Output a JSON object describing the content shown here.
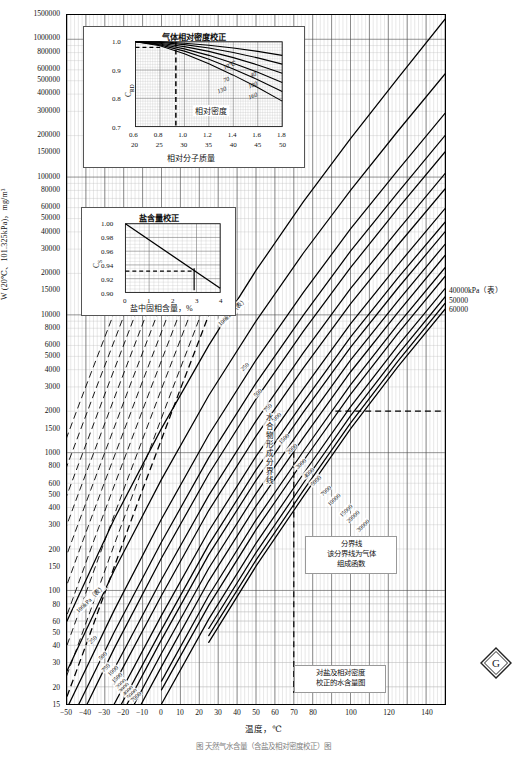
{
  "figure": {
    "caption": "图   天然气水含量（含盐及相对密度校正）图"
  },
  "axes": {
    "y_title": "W (20℃、101.325kPa)，mg/m³",
    "x_title": "温度，℃",
    "y_ticks": [
      "1500000",
      "1000000",
      "800000",
      "600000",
      "500000",
      "400000",
      "300000",
      "200000",
      "150000",
      "100000",
      "80000",
      "60000",
      "50000",
      "40000",
      "30000",
      "20000",
      "15000",
      "10000",
      "8000",
      "6000",
      "5000",
      "4000",
      "3000",
      "2000",
      "1500",
      "1000",
      "800",
      "600",
      "500",
      "400",
      "300",
      "200",
      "150",
      "100",
      "80",
      "60",
      "50",
      "40",
      "30",
      "20",
      "15"
    ],
    "x_ticks": [
      "-50",
      "-40",
      "-30",
      "-20",
      "-10",
      "0",
      "10",
      "20",
      "30",
      "40",
      "50",
      "60",
      "70",
      "80",
      "100",
      "120",
      "140"
    ]
  },
  "right_labels": [
    "40000kPa（表）",
    "50000",
    "60000"
  ],
  "pressure_labels": [
    "100kPa（表）",
    "250",
    "500",
    "750",
    "1000",
    "1500",
    "2000",
    "3000",
    "4000",
    "5000",
    "7000",
    "10000",
    "15000",
    "20000",
    "30000"
  ],
  "annotations": {
    "hydrate_line": "水合物形成分界线",
    "boundary_note": "分界线\n该分界线为气体\n组成函数",
    "corrected_note": "对盐及相对密度\n校正的水含量图",
    "logo": "gas-processors-logo"
  },
  "inset_density": {
    "title": "气体相对密度校正",
    "y_label": "C",
    "y_sub": "RD",
    "x_label_top": "相对密度",
    "x_label_bottom": "相对分子质量",
    "y_ticks": [
      "1.0",
      "0.9",
      "0.8",
      "0.7"
    ],
    "x_ticks_density": [
      "0.6",
      "0.8",
      "1.0",
      "1.2",
      "1.4",
      "1.6",
      "1.8"
    ],
    "x_ticks_mass": [
      "20",
      "25",
      "30",
      "35",
      "40",
      "45",
      "50"
    ],
    "curve_labels": [
      "10℃",
      "40",
      "70",
      "100",
      "130",
      "160"
    ]
  },
  "inset_salt": {
    "title": "盐含量校正",
    "y_label": "C",
    "y_sub": "S",
    "x_label": "盐中固相含量，%",
    "y_ticks": [
      "1.00",
      "0.98",
      "0.96",
      "0.94",
      "0.92",
      "0.90"
    ],
    "x_ticks": [
      "0",
      "1",
      "2",
      "3",
      "4"
    ]
  },
  "chart_data": {
    "type": "line",
    "xlabel": "温度，℃",
    "ylabel": "W (20℃、101.325kPa)，mg/m³",
    "xlim": [
      -50,
      150
    ],
    "ylim": [
      15,
      1500000
    ],
    "yscale": "log",
    "xscale": "linear",
    "grid": true,
    "legend": "inline curve labels",
    "series": [
      {
        "name": "100kPa（表）",
        "x": [
          -50,
          -25,
          0,
          25,
          50,
          75,
          100,
          125,
          150
        ],
        "values": [
          60,
          330,
          1500,
          6000,
          21000,
          66000,
          190000,
          520000,
          1400000
        ]
      },
      {
        "name": "250",
        "x": [
          -50,
          -25,
          0,
          25,
          50,
          75,
          100,
          125,
          150
        ],
        "values": [
          26,
          140,
          640,
          2600,
          9000,
          28000,
          80000,
          215000,
          560000
        ]
      },
      {
        "name": "500",
        "x": [
          -50,
          -25,
          0,
          25,
          50,
          75,
          100,
          125,
          150
        ],
        "values": [
          14,
          72,
          330,
          1350,
          4700,
          14500,
          42000,
          112000,
          290000
        ]
      },
      {
        "name": "750",
        "x": [
          -50,
          -25,
          0,
          25,
          50,
          75,
          100,
          125,
          150
        ],
        "values": [
          10,
          50,
          225,
          920,
          3200,
          9900,
          29000,
          77000,
          200000
        ]
      },
      {
        "name": "1000",
        "x": [
          -50,
          -25,
          0,
          25,
          50,
          75,
          100,
          125,
          150
        ],
        "values": [
          7.5,
          38,
          172,
          700,
          2450,
          7600,
          22000,
          59000,
          152000
        ]
      },
      {
        "name": "1500",
        "x": [
          -25,
          0,
          25,
          50,
          75,
          100,
          125,
          150
        ],
        "values": [
          27,
          120,
          490,
          1700,
          5300,
          15500,
          41000,
          106000
        ]
      },
      {
        "name": "2000",
        "x": [
          -25,
          0,
          25,
          50,
          75,
          100,
          125,
          150
        ],
        "values": [
          21,
          92,
          380,
          1320,
          4100,
          12000,
          32000,
          82000
        ]
      },
      {
        "name": "3000",
        "x": [
          -25,
          0,
          25,
          50,
          75,
          100,
          125,
          150
        ],
        "values": [
          15,
          66,
          270,
          940,
          2900,
          8600,
          23000,
          59000
        ]
      },
      {
        "name": "4000",
        "x": [
          -25,
          0,
          25,
          50,
          75,
          100,
          125,
          150
        ],
        "values": [
          12,
          52,
          215,
          750,
          2320,
          6900,
          18500,
          47000
        ]
      },
      {
        "name": "5000",
        "x": [
          -25,
          0,
          25,
          50,
          75,
          100,
          125,
          150
        ],
        "values": [
          10,
          44,
          182,
          630,
          1960,
          5800,
          15600,
          40000
        ]
      },
      {
        "name": "7000",
        "x": [
          -25,
          0,
          25,
          50,
          75,
          100,
          125,
          150
        ],
        "values": [
          8,
          35,
          145,
          505,
          1570,
          4700,
          12600,
          32500
        ]
      },
      {
        "name": "10000",
        "x": [
          -25,
          0,
          25,
          50,
          75,
          100,
          125,
          150
        ],
        "values": [
          6.5,
          28,
          117,
          410,
          1280,
          3850,
          10400,
          27000
        ]
      },
      {
        "name": "15000",
        "x": [
          0,
          25,
          50,
          75,
          100,
          125,
          150
        ],
        "values": [
          22,
          92,
          325,
          1020,
          3100,
          8500,
          22000
        ]
      },
      {
        "name": "20000",
        "x": [
          0,
          25,
          50,
          75,
          100,
          125,
          150
        ],
        "values": [
          19,
          78,
          276,
          870,
          2650,
          7300,
          19000
        ]
      },
      {
        "name": "30000",
        "x": [
          0,
          25,
          50,
          75,
          100,
          125,
          150
        ],
        "values": [
          15,
          62,
          220,
          700,
          2150,
          5950,
          15500
        ]
      },
      {
        "name": "40000kPa（表）",
        "x": [
          25,
          50,
          75,
          100,
          125,
          150
        ],
        "values": [
          53,
          188,
          600,
          1850,
          5150,
          13500
        ]
      },
      {
        "name": "50000",
        "x": [
          25,
          50,
          75,
          100,
          125,
          150
        ],
        "values": [
          47,
          166,
          530,
          1640,
          4600,
          12100
        ]
      },
      {
        "name": "60000",
        "x": [
          25,
          50,
          75,
          100,
          125,
          150
        ],
        "values": [
          42,
          150,
          480,
          1490,
          4200,
          11000
        ]
      }
    ],
    "hydrate_boundary": {
      "name": "水合物形成分界线",
      "x": [
        -50,
        -40,
        -30,
        -20,
        -10,
        0,
        10,
        20,
        25
      ],
      "values": [
        17,
        40,
        96,
        230,
        540,
        1250,
        2900,
        6600,
        10000
      ]
    }
  }
}
